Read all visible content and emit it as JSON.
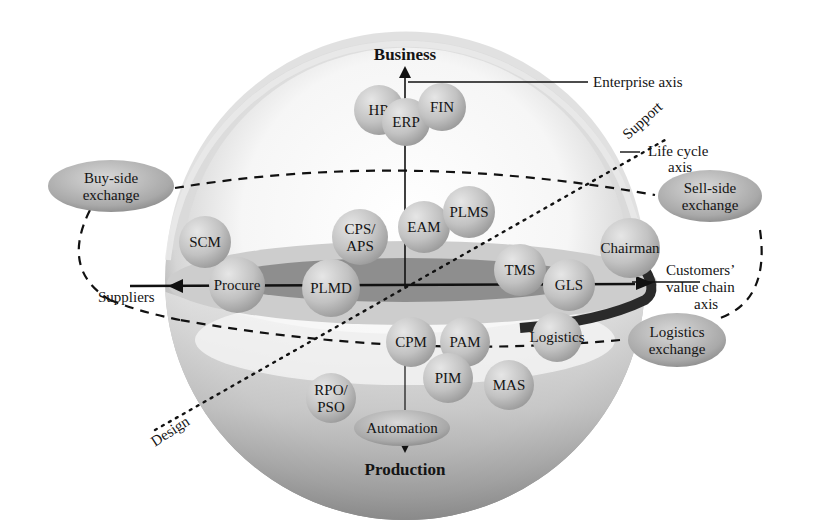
{
  "diagram": {
    "axes": {
      "enterprise": {
        "top_label": "Business",
        "bottom_label": "Production",
        "caption": "Enterprise axis"
      },
      "value_chain": {
        "left_label": "Suppliers",
        "caption_lines": [
          "Customers’",
          "value chain",
          "axis"
        ]
      },
      "life_cycle": {
        "start_label": "Design",
        "end_label": "Support",
        "caption_lines": [
          "Life cycle",
          "axis"
        ]
      }
    },
    "modules": [
      {
        "id": "hr",
        "lines": [
          "HR"
        ],
        "cx": 379,
        "cy": 110,
        "r": 25
      },
      {
        "id": "erp",
        "lines": [
          "ERP"
        ],
        "cx": 406,
        "cy": 122,
        "r": 24
      },
      {
        "id": "fin",
        "lines": [
          "FIN"
        ],
        "cx": 442,
        "cy": 107,
        "r": 24
      },
      {
        "id": "scm",
        "lines": [
          "SCM"
        ],
        "cx": 205,
        "cy": 242,
        "r": 26
      },
      {
        "id": "cps-aps",
        "lines": [
          "CPS/",
          "APS"
        ],
        "cx": 360,
        "cy": 237,
        "r": 28
      },
      {
        "id": "eam",
        "lines": [
          "EAM"
        ],
        "cx": 424,
        "cy": 227,
        "r": 26
      },
      {
        "id": "plms",
        "lines": [
          "PLMS"
        ],
        "cx": 469,
        "cy": 212,
        "r": 26
      },
      {
        "id": "chairman",
        "lines": [
          "Chairman"
        ],
        "cx": 630,
        "cy": 248,
        "r": 30
      },
      {
        "id": "procure",
        "lines": [
          "Procure"
        ],
        "cx": 237,
        "cy": 285,
        "r": 28
      },
      {
        "id": "plmd",
        "lines": [
          "PLMD"
        ],
        "cx": 331,
        "cy": 288,
        "r": 29
      },
      {
        "id": "tms",
        "lines": [
          "TMS"
        ],
        "cx": 520,
        "cy": 270,
        "r": 26
      },
      {
        "id": "gls",
        "lines": [
          "GLS"
        ],
        "cx": 569,
        "cy": 285,
        "r": 26
      },
      {
        "id": "cpm",
        "lines": [
          "CPM"
        ],
        "cx": 411,
        "cy": 342,
        "r": 25
      },
      {
        "id": "pam",
        "lines": [
          "PAM"
        ],
        "cx": 465,
        "cy": 342,
        "r": 25
      },
      {
        "id": "logistics",
        "lines": [
          "Logistics"
        ],
        "cx": 557,
        "cy": 337,
        "r": 25
      },
      {
        "id": "pim",
        "lines": [
          "PIM"
        ],
        "cx": 448,
        "cy": 378,
        "r": 25
      },
      {
        "id": "mas",
        "lines": [
          "MAS"
        ],
        "cx": 509,
        "cy": 385,
        "r": 25
      },
      {
        "id": "rpo-pso",
        "lines": [
          "RPO/",
          "PSO"
        ],
        "cx": 331,
        "cy": 398,
        "r": 25
      }
    ],
    "exchanges": [
      {
        "id": "buy-side",
        "lines": [
          "Buy-side",
          "exchange"
        ],
        "cx": 111,
        "cy": 186,
        "rx": 63,
        "ry": 26
      },
      {
        "id": "sell-side",
        "lines": [
          "Sell-side",
          "exchange"
        ],
        "cx": 710,
        "cy": 196,
        "rx": 52,
        "ry": 26
      },
      {
        "id": "logistics-exchange",
        "lines": [
          "Logistics",
          "exchange"
        ],
        "cx": 677,
        "cy": 340,
        "rx": 49,
        "ry": 27
      },
      {
        "id": "automation",
        "lines": [
          "Automation"
        ],
        "cx": 402,
        "cy": 428,
        "rx": 48,
        "ry": 18
      }
    ],
    "colors": {
      "sphere_light": "#f4f4f4",
      "sphere_mid": "#c9c9c9",
      "sphere_dark": "#6e6e6e",
      "module_fill": "#bdbdbd",
      "ring_outer": "#cfcfcf",
      "ring_inner": "#8a8a8a",
      "line": "#111111"
    }
  }
}
